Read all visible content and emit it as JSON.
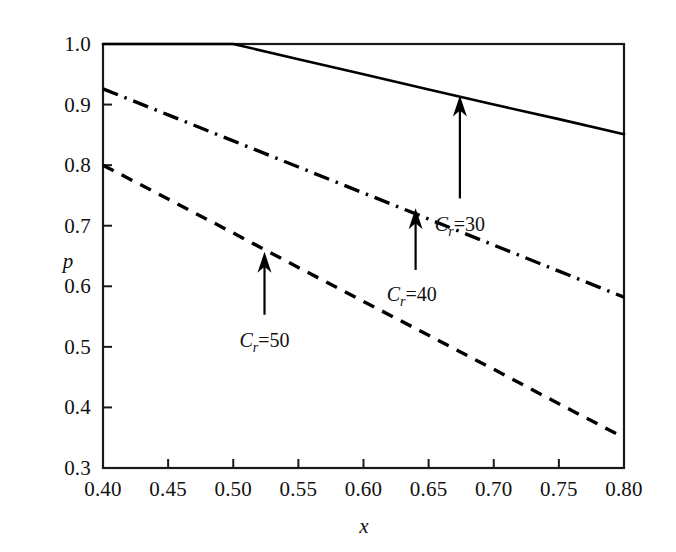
{
  "chart_data": {
    "type": "line",
    "title": "",
    "xlabel": "x",
    "ylabel": "p",
    "xlim": [
      0.4,
      0.8
    ],
    "ylim": [
      0.3,
      1.0
    ],
    "grid": false,
    "legend_position": "none",
    "xticks": [
      "0.40",
      "0.45",
      "0.50",
      "0.55",
      "0.60",
      "0.65",
      "0.70",
      "0.75",
      "0.80"
    ],
    "xtick_values": [
      0.4,
      0.45,
      0.5,
      0.55,
      0.6,
      0.65,
      0.7,
      0.75,
      0.8
    ],
    "yticks": [
      "0.3",
      "0.4",
      "0.5",
      "0.6",
      "0.7",
      "0.8",
      "0.9",
      "1.0"
    ],
    "ytick_values": [
      0.3,
      0.4,
      0.5,
      0.6,
      0.7,
      0.8,
      0.9,
      1.0
    ],
    "series": [
      {
        "name": "C_r=30",
        "style": "solid",
        "color": "#000000",
        "x": [
          0.4,
          0.45,
          0.5,
          0.55,
          0.6,
          0.65,
          0.7,
          0.75,
          0.8
        ],
        "values": [
          1.0,
          1.0,
          1.0,
          0.975,
          0.95,
          0.925,
          0.9,
          0.876,
          0.851
        ]
      },
      {
        "name": "C_r=40",
        "style": "dashdot",
        "color": "#000000",
        "x": [
          0.4,
          0.45,
          0.5,
          0.55,
          0.6,
          0.65,
          0.7,
          0.75,
          0.8
        ],
        "values": [
          0.926,
          0.883,
          0.84,
          0.797,
          0.754,
          0.711,
          0.668,
          0.625,
          0.582
        ]
      },
      {
        "name": "C_r=50",
        "style": "dashed",
        "color": "#000000",
        "x": [
          0.4,
          0.45,
          0.5,
          0.55,
          0.6,
          0.65,
          0.7,
          0.75,
          0.8
        ],
        "values": [
          0.8,
          0.744,
          0.688,
          0.631,
          0.575,
          0.519,
          0.463,
          0.406,
          0.35
        ]
      }
    ],
    "annotations": [
      {
        "label_prefix": "C",
        "label_sub": "r",
        "label_suffix": "=30",
        "label_full": "C_r=30",
        "tip_x": 0.674,
        "tip_y": 0.915,
        "tail_x": 0.674,
        "tail_y": 0.745,
        "text_x": 0.674,
        "text_y": 0.692
      },
      {
        "label_prefix": "C",
        "label_sub": "r",
        "label_suffix": "=40",
        "label_full": "C_r=40",
        "tip_x": 0.64,
        "tip_y": 0.729,
        "tail_x": 0.64,
        "tail_y": 0.627,
        "text_x": 0.637,
        "text_y": 0.575
      },
      {
        "label_prefix": "C",
        "label_sub": "r",
        "label_suffix": "=50",
        "label_full": "C_r=50",
        "tip_x": 0.524,
        "tip_y": 0.657,
        "tail_x": 0.524,
        "tail_y": 0.553,
        "text_x": 0.524,
        "text_y": 0.5
      }
    ]
  },
  "axes": {
    "y_axis_title": "p",
    "x_axis_title": "x"
  }
}
